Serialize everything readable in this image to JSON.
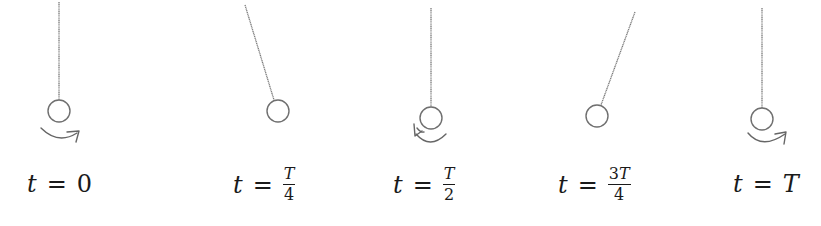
{
  "diagram": {
    "title": "",
    "colors": {
      "string": "#7a7a7a",
      "bob": "#6f6f6f",
      "arrow": "#666666",
      "text": "#1a1a1a",
      "background": "#ffffff"
    },
    "snapshots": [
      {
        "id": "t0",
        "label": {
          "var": "t",
          "eq": "=",
          "value": "0",
          "is_fraction": false
        },
        "string": {
          "x1": 59,
          "y1": 2,
          "x2": 59,
          "y2": 100
        },
        "bob": {
          "cx": 59,
          "cy": 111,
          "r": 11
        },
        "rotation_arrow": "clockwise-right"
      },
      {
        "id": "tT4",
        "label": {
          "var": "t",
          "eq": "=",
          "num_coef": "",
          "num_var": "T",
          "den": "4",
          "is_fraction": true
        },
        "string": {
          "x1": 245,
          "y1": 5,
          "x2": 274,
          "y2": 100
        },
        "bob": {
          "cx": 278,
          "cy": 111,
          "r": 11
        },
        "rotation_arrow": "none"
      },
      {
        "id": "tT2",
        "label": {
          "var": "t",
          "eq": "=",
          "num_coef": "",
          "num_var": "T",
          "den": "2",
          "is_fraction": true
        },
        "string": {
          "x1": 431,
          "y1": 8,
          "x2": 431,
          "y2": 107
        },
        "bob": {
          "cx": 431,
          "cy": 118,
          "r": 11
        },
        "rotation_arrow": "counterclockwise-left"
      },
      {
        "id": "t3T4",
        "label": {
          "var": "t",
          "eq": "=",
          "num_coef": "3",
          "num_var": "T",
          "den": "4",
          "is_fraction": true
        },
        "string": {
          "x1": 635,
          "y1": 12,
          "x2": 601,
          "y2": 105
        },
        "bob": {
          "cx": 597,
          "cy": 116,
          "r": 11
        },
        "rotation_arrow": "none"
      },
      {
        "id": "tT",
        "label": {
          "var": "t",
          "eq": "=",
          "value_var": "T",
          "is_fraction": false
        },
        "string": {
          "x1": 762,
          "y1": 8,
          "x2": 762,
          "y2": 108
        },
        "bob": {
          "cx": 762,
          "cy": 119,
          "r": 11
        },
        "rotation_arrow": "clockwise-right"
      }
    ],
    "labels_text": {
      "t0": "t = 0",
      "tT4": "t = T/4",
      "tT2": "t = T/2",
      "t3T4": "t = 3T/4",
      "tT": "t = T"
    },
    "icons": {
      "rotation_arrow_right": "curved-arrow-right-icon",
      "rotation_arrow_left": "curved-arrow-left-icon"
    }
  }
}
